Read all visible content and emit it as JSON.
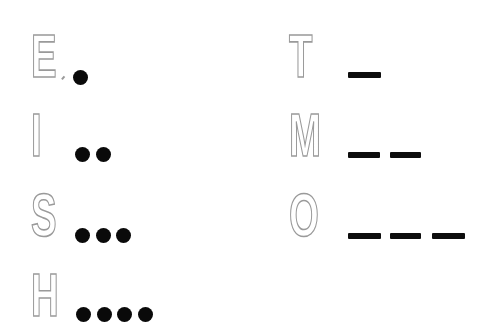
{
  "colors": {
    "letter_outline": "#9a9a9a",
    "letter_fill": "#ffffff",
    "symbol": "#0a0a0a",
    "background": "#ffffff"
  },
  "left_column": [
    {
      "letter": "E",
      "code": "•",
      "symbols": [
        "dot"
      ]
    },
    {
      "letter": "I",
      "code": "••",
      "symbols": [
        "dot",
        "dot"
      ]
    },
    {
      "letter": "S",
      "code": "•••",
      "symbols": [
        "dot",
        "dot",
        "dot"
      ]
    },
    {
      "letter": "H",
      "code": "••••",
      "symbols": [
        "dot",
        "dot",
        "dot",
        "dot"
      ]
    }
  ],
  "right_column": [
    {
      "letter": "T",
      "code": "–",
      "symbols": [
        "dash"
      ]
    },
    {
      "letter": "M",
      "code": "––",
      "symbols": [
        "dash",
        "dash"
      ]
    },
    {
      "letter": "O",
      "code": "–––",
      "symbols": [
        "dash",
        "dash",
        "dash"
      ]
    }
  ]
}
